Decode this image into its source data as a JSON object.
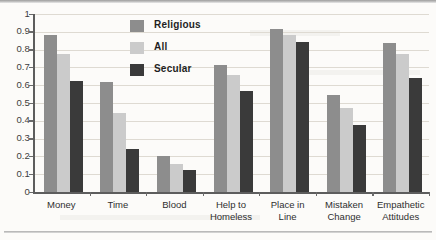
{
  "chart_data": {
    "type": "bar",
    "title": "",
    "xlabel": "",
    "ylabel": "",
    "ylim": [
      0,
      1
    ],
    "ytick_labels": [
      "1",
      "0.9",
      "0.8",
      "0.7",
      "0.6",
      "0.5",
      "0.4",
      "0.3",
      "0.2",
      "0.1",
      "0"
    ],
    "ytick_values": [
      1,
      0.9,
      0.8,
      0.7,
      0.6,
      0.5,
      0.4,
      0.3,
      0.2,
      0.1,
      0
    ],
    "grid": true,
    "legend_position": "inside-top-center",
    "categories": [
      "Money",
      "Time",
      "Blood",
      "Help to Homeless",
      "Place in Line",
      "Mistaken Change",
      "Empathetic Attitudes"
    ],
    "category_lines": [
      [
        "Money"
      ],
      [
        "Time"
      ],
      [
        "Blood"
      ],
      [
        "Help to",
        "Homeless"
      ],
      [
        "Place in",
        "Line"
      ],
      [
        "Mistaken",
        "Change"
      ],
      [
        "Empathetic",
        "Attitudes"
      ]
    ],
    "series": [
      {
        "name": "Religious",
        "color": "#8d8d8d",
        "values": [
          0.88,
          0.62,
          0.205,
          0.715,
          0.915,
          0.545,
          0.84
        ]
      },
      {
        "name": "All",
        "color": "#cbcbcb",
        "values": [
          0.775,
          0.445,
          0.155,
          0.66,
          0.885,
          0.475,
          0.775
        ]
      },
      {
        "name": "Secular",
        "color": "#3a3a3a",
        "values": [
          0.625,
          0.24,
          0.125,
          0.565,
          0.845,
          0.375,
          0.64
        ]
      }
    ]
  },
  "colors": {
    "religious": "#8d8d8d",
    "all": "#cbcbcb",
    "secular": "#3a3a3a",
    "axis": "#5d5d5d",
    "gridline": "#dedad2",
    "background": "#fcfbf9",
    "text": "#2f2f2f"
  }
}
